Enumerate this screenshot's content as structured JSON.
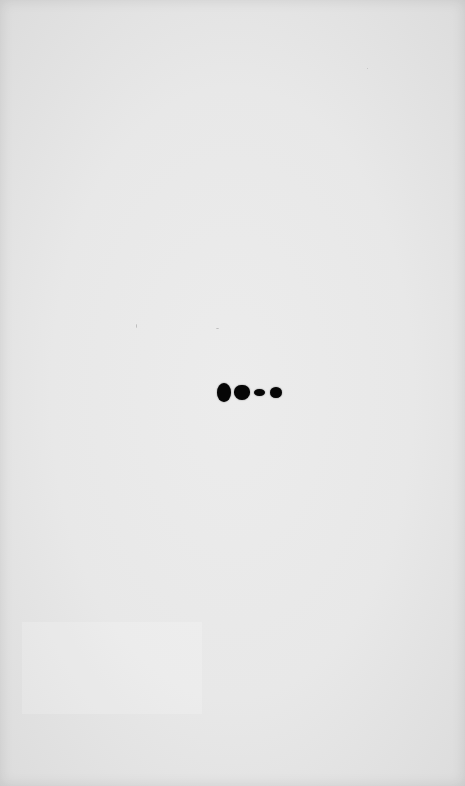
{
  "image": {
    "description": "Blot membrane with a single row of four dark bands",
    "background_color": "#e8e8e8",
    "band_color": "#060606"
  },
  "bands": [
    {
      "lane": 1,
      "x": 217,
      "y": 383,
      "w": 14,
      "h": 19
    },
    {
      "lane": 2,
      "x": 234,
      "y": 385,
      "w": 16,
      "h": 15
    },
    {
      "lane": 3,
      "x": 254,
      "y": 389,
      "w": 11,
      "h": 7
    },
    {
      "lane": 4,
      "x": 270,
      "y": 387,
      "w": 12,
      "h": 11
    }
  ]
}
